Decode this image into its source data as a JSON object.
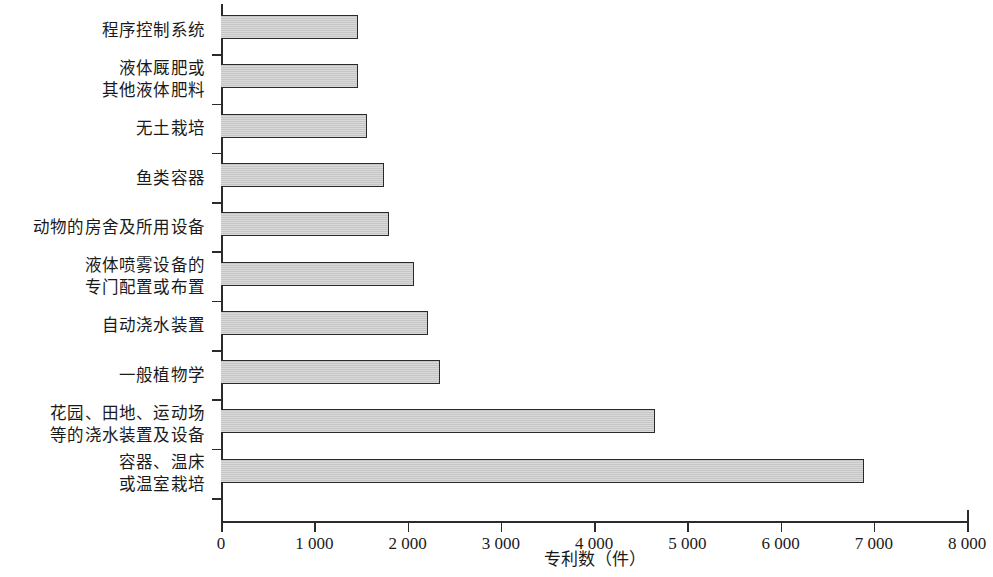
{
  "chart": {
    "type": "bar",
    "orientation": "horizontal",
    "bar_fill_color": "#c9c9c9",
    "bar_border_color": "#2a2a2a",
    "axis_color": "#2b2b2b",
    "grid": false,
    "legend": false
  },
  "chart_data": {
    "type": "bar",
    "title": "",
    "subtitle": "",
    "xlabel": "专利数（件）",
    "ylabel": "",
    "xlim": [
      0,
      8000
    ],
    "xticks": [
      0,
      1000,
      2000,
      3000,
      4000,
      5000,
      6000,
      7000,
      8000
    ],
    "xticklabels": [
      "0",
      "1 000",
      "2 000",
      "3 000",
      "4 000",
      "5 000",
      "6 000",
      "7 000",
      "8 000"
    ],
    "grid": false,
    "legend_position": "none",
    "orientation": "horizontal",
    "categories": [
      "程序控制系统",
      "液体厩肥或其他液体肥料",
      "无土栽培",
      "鱼类容器",
      "动物的房舍及所用设备",
      "液体喷雾设备的专门配置或布置",
      "自动浇水装置",
      "一般植物学",
      "花园、田地、运动场等的浇水装置及设备",
      "容器、温床或温室栽培"
    ],
    "values": [
      1470,
      1470,
      1570,
      1750,
      1800,
      2070,
      2220,
      2350,
      4650,
      6900
    ]
  },
  "y_axis": {
    "labels": [
      {
        "lines": [
          "程序控制系统"
        ]
      },
      {
        "lines": [
          "液体厩肥或",
          "其他液体肥料"
        ]
      },
      {
        "lines": [
          "无土栽培"
        ]
      },
      {
        "lines": [
          "鱼类容器"
        ]
      },
      {
        "lines": [
          "动物的房舍及所用设备"
        ]
      },
      {
        "lines": [
          "液体喷雾设备的",
          "专门配置或布置"
        ]
      },
      {
        "lines": [
          "自动浇水装置"
        ]
      },
      {
        "lines": [
          "一般植物学"
        ]
      },
      {
        "lines": [
          "花园、田地、运动场",
          "等的浇水装置及设备"
        ]
      },
      {
        "lines": [
          "容器、温床",
          "或温室栽培"
        ]
      }
    ]
  }
}
